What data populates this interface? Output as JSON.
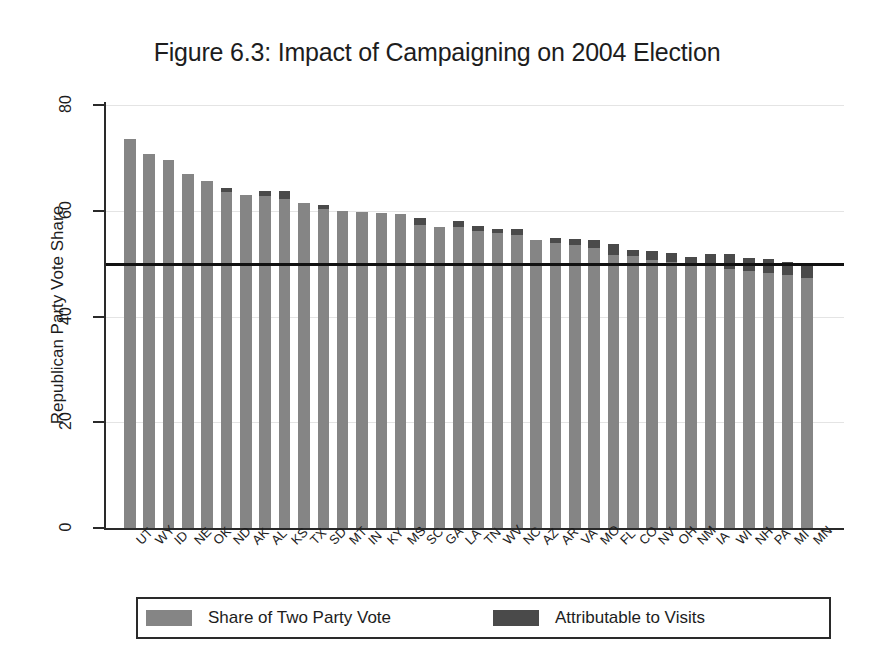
{
  "chart_data": {
    "type": "bar",
    "title": "Figure 6.3: Impact of Campaigning on 2004 Election",
    "xlabel": "",
    "ylabel": "Republican Party Vote Share",
    "ylim": [
      0,
      80
    ],
    "yticks": [
      0,
      20,
      40,
      60,
      80
    ],
    "ytick_labels": [
      "0",
      "20",
      "40",
      "60",
      "80"
    ],
    "grid": true,
    "stacked": true,
    "legend_position": "bottom",
    "reference_line": {
      "value": 50,
      "label": "50% two-party vote threshold",
      "color": "#111111"
    },
    "colors": {
      "share_of_two_party_vote": "#858585",
      "attributable_to_visits": "#4a4a4a",
      "axis": "#2a2a2a",
      "gridline": "#e4e4e4",
      "text": "#1d1d1d"
    },
    "categories": [
      "UT",
      "WY",
      "ID",
      "NE",
      "OK",
      "ND",
      "AK",
      "AL",
      "KS",
      "TX",
      "SD",
      "MT",
      "IN",
      "KY",
      "MS",
      "SC",
      "GA",
      "LA",
      "TN",
      "WV",
      "NC",
      "AZ",
      "AR",
      "VA",
      "MO",
      "FL",
      "CO",
      "NV",
      "OH",
      "NM",
      "IA",
      "WI",
      "NH",
      "PA",
      "MI",
      "MN"
    ],
    "series": [
      {
        "name": "Share of Two Party Vote",
        "color": "#858585",
        "values": [
          73.5,
          70.8,
          69.6,
          67.0,
          65.7,
          63.6,
          62.9,
          62.8,
          62.2,
          61.4,
          60.4,
          59.9,
          59.8,
          59.6,
          59.4,
          57.3,
          57.0,
          56.9,
          56.2,
          55.8,
          55.4,
          54.4,
          53.9,
          53.5,
          52.9,
          51.7,
          51.4,
          50.7,
          50.3,
          49.8,
          49.6,
          48.9,
          48.6,
          48.3,
          47.9,
          47.3
        ]
      },
      {
        "name": "Attributable to Visits",
        "color": "#4a4a4a",
        "values": [
          0.0,
          0.0,
          0.0,
          0.0,
          0.0,
          0.7,
          0.0,
          1.0,
          1.6,
          0.0,
          0.6,
          0.0,
          0.0,
          0.0,
          0.0,
          1.3,
          0.0,
          1.2,
          0.9,
          0.7,
          1.1,
          0.0,
          1.0,
          1.2,
          1.5,
          2.1,
          1.1,
          1.6,
          1.7,
          1.5,
          2.2,
          3.0,
          2.4,
          2.5,
          2.4,
          2.9
        ]
      }
    ],
    "totals": [
      73.5,
      70.8,
      69.6,
      67.0,
      65.7,
      64.3,
      62.9,
      63.8,
      63.8,
      61.4,
      61.0,
      59.9,
      59.8,
      59.6,
      59.4,
      58.6,
      57.0,
      58.1,
      57.1,
      56.5,
      56.5,
      54.4,
      54.9,
      54.7,
      54.4,
      53.8,
      52.5,
      52.3,
      52.0,
      51.3,
      51.8,
      51.9,
      51.0,
      50.8,
      50.3,
      50.2
    ]
  },
  "legend": {
    "entries": [
      {
        "label": "Share of Two Party Vote",
        "color": "#858585"
      },
      {
        "label": "Attributable to Visits",
        "color": "#4a4a4a"
      }
    ]
  }
}
